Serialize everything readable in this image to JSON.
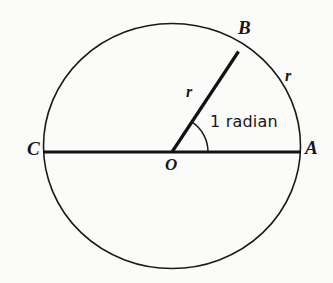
{
  "figure": {
    "name": "radian-definition-circle-diagram",
    "background_color": "#fbfbfa",
    "stroke_color": "#1a1a1a",
    "circle": {
      "center_x": 172,
      "center_y": 146,
      "radius_x": 128,
      "radius_y": 122,
      "stroke_width": 1.6
    },
    "diameter_line": {
      "name": "diameter-CA",
      "x1": 43,
      "y1": 152,
      "x2": 301,
      "y2": 152,
      "stroke_width": 3.2
    },
    "radius_line": {
      "name": "radius-OB",
      "x1": 172,
      "y1": 152,
      "x2": 238,
      "y2": 52,
      "stroke_width": 3.2
    },
    "angle_arc": {
      "name": "angle-arc-1-radian",
      "center_x": 172,
      "center_y": 152,
      "radius": 36,
      "start_angle_deg": 0,
      "end_angle_deg": 56.6,
      "stroke_width": 1.5
    },
    "points": {
      "A": {
        "label": "A",
        "x": 301,
        "y": 152
      },
      "B": {
        "label": "B",
        "x": 238,
        "y": 52
      },
      "C": {
        "label": "C",
        "x": 43,
        "y": 152
      },
      "O": {
        "label": "O",
        "x": 172,
        "y": 152
      }
    },
    "labels": {
      "radius_label": "r",
      "arc_label": "r",
      "angle_label": "1 radian"
    }
  }
}
